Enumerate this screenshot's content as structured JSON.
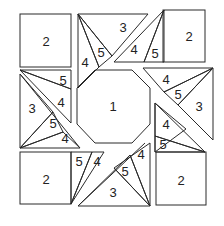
{
  "diagram": {
    "type": "quilt-block-piece-diagram",
    "stroke_color": "#2a2a2a",
    "background": "#ffffff",
    "labels": {
      "center": "1",
      "tl_square": "2",
      "tr_square": "2",
      "bl_square": "2",
      "br_square": "2",
      "top_3": "3",
      "top_5a": "5",
      "top_4a": "4",
      "top_4b": "4",
      "top_5b": "5",
      "right_4a": "4",
      "right_5a": "5",
      "right_3": "3",
      "right_4b": "4",
      "right_5b": "5",
      "left_5a": "5",
      "left_4a": "4",
      "left_3": "3",
      "left_5b": "5",
      "left_4b": "4",
      "bottom_5a": "5",
      "bottom_4a": "4",
      "bottom_4b": "4",
      "bottom_5b": "5",
      "bottom_3": "3"
    },
    "piece_legend": [
      {
        "id": "1",
        "shape": "octagon (center)"
      },
      {
        "id": "2",
        "shape": "corner square"
      },
      {
        "id": "3",
        "shape": "large triangle"
      },
      {
        "id": "4",
        "shape": "narrow triangle"
      },
      {
        "id": "5",
        "shape": "small triangle"
      }
    ]
  }
}
